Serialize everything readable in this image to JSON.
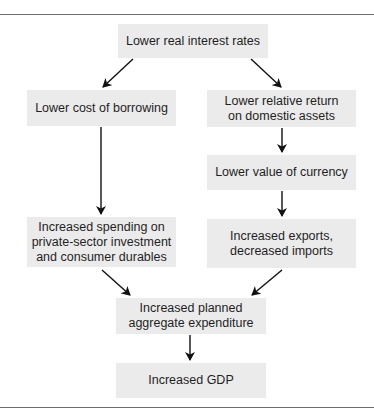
{
  "diagram": {
    "type": "flowchart",
    "nodes": [
      {
        "id": "rates",
        "label": "Lower real interest rates"
      },
      {
        "id": "borrowing",
        "label": "Lower cost of borrowing"
      },
      {
        "id": "return",
        "label": "Lower relative return on domestic assets"
      },
      {
        "id": "currency",
        "label": "Lower value of currency"
      },
      {
        "id": "spending",
        "label": "Increased spending on private-sector investment and consumer durables"
      },
      {
        "id": "exports",
        "label": "Increased exports, decreased imports"
      },
      {
        "id": "expenditure",
        "label": "Increased planned aggregate expenditure"
      },
      {
        "id": "gdp",
        "label": "Increased GDP"
      }
    ],
    "edges": [
      {
        "from": "rates",
        "to": "borrowing"
      },
      {
        "from": "rates",
        "to": "return"
      },
      {
        "from": "return",
        "to": "currency"
      },
      {
        "from": "borrowing",
        "to": "spending"
      },
      {
        "from": "currency",
        "to": "exports"
      },
      {
        "from": "spending",
        "to": "expenditure"
      },
      {
        "from": "exports",
        "to": "expenditure"
      },
      {
        "from": "expenditure",
        "to": "gdp"
      }
    ]
  },
  "labels": {
    "rates": "Lower real interest rates",
    "borrowing": "Lower cost of borrowing",
    "return_l1": "Lower relative return",
    "return_l2": "on domestic assets",
    "currency": "Lower value of currency",
    "spending_l1": "Increased spending on",
    "spending_l2": "private-sector investment",
    "spending_l3": "and consumer durables",
    "exports_l1": "Increased exports,",
    "exports_l2": "decreased imports",
    "expenditure_l1": "Increased planned",
    "expenditure_l2": "aggregate expenditure",
    "gdp": "Increased GDP"
  },
  "colors": {
    "box_fill": "#ebebeb",
    "arrow": "#111111",
    "rule": "#6e6e6e"
  }
}
